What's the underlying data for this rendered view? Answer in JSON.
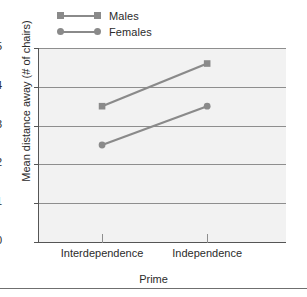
{
  "chart_data": {
    "type": "line",
    "title": "",
    "subtitle": "",
    "xlabel": "Prime",
    "ylabel": "Mean distance away (# of chairs)",
    "categories": [
      "Interdependence",
      "Independence"
    ],
    "series": [
      {
        "name": "Males",
        "values": [
          3.5,
          4.6
        ],
        "marker": "square",
        "color": "#8a8a8a"
      },
      {
        "name": "Females",
        "values": [
          2.5,
          3.5
        ],
        "marker": "circle",
        "color": "#8a8a8a"
      }
    ],
    "ylim": [
      0,
      5
    ],
    "yticks": [
      "0",
      "1",
      "2",
      "3",
      "4",
      "5"
    ],
    "grid": "horizontal",
    "legend_position": "above-left",
    "plot_background": "#f2f2f2",
    "gridline_color": "#8e8e8e",
    "axis_color": "#555555"
  },
  "legend": {
    "items": [
      {
        "label": "Males",
        "marker": "square-marker"
      },
      {
        "label": "Females",
        "marker": "round-marker"
      }
    ]
  },
  "axes": {
    "y": {
      "title": "Mean distance away (# of chairs)",
      "ticks": [
        "5",
        "4",
        "3",
        "2",
        "1",
        "0"
      ]
    },
    "x": {
      "title": "Prime",
      "ticks": [
        "Interdependence",
        "Independence"
      ]
    }
  }
}
